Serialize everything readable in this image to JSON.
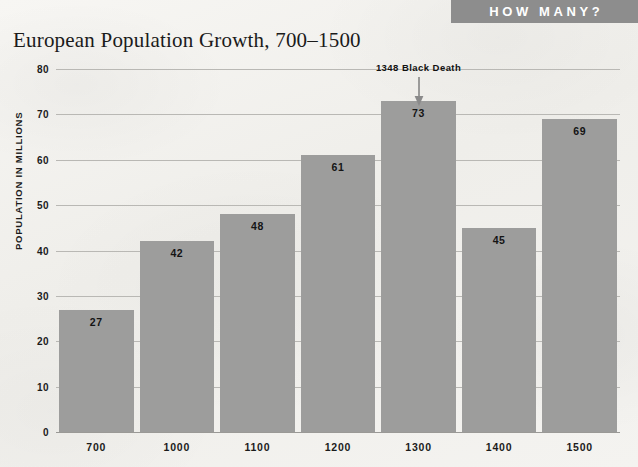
{
  "banner": {
    "label": "HOW MANY?",
    "bg_color": "#8d8d8d",
    "text_color": "#ffffff"
  },
  "title": "European Population Growth, 700–1500",
  "axis": {
    "y_title": "POPULATION IN MILLIONS"
  },
  "annotation": {
    "label": "1348 Black Death",
    "arrow_icon": "down-arrow-icon"
  },
  "colors": {
    "bar": "#9d9d9c",
    "gridline": "#b9b8b4",
    "background": "#f3f2ef",
    "text": "#1b1b1b"
  },
  "chart_data": {
    "type": "bar",
    "title": "European Population Growth, 700–1500",
    "xlabel": "",
    "ylabel": "POPULATION IN MILLIONS",
    "categories": [
      "700",
      "1000",
      "1100",
      "1200",
      "1300",
      "1400",
      "1500"
    ],
    "values": [
      27,
      42,
      48,
      61,
      73,
      45,
      69
    ],
    "ylim": [
      0,
      80
    ],
    "yticks": [
      0,
      10,
      20,
      30,
      40,
      50,
      60,
      70,
      80
    ],
    "ytick_labels": [
      "0",
      "10",
      "20",
      "30",
      "40",
      "50",
      "60",
      "70",
      "80"
    ],
    "grid": true,
    "legend": false,
    "annotations": [
      {
        "text": "1348 Black Death",
        "points_to_category": "1300",
        "position": "top"
      }
    ]
  }
}
